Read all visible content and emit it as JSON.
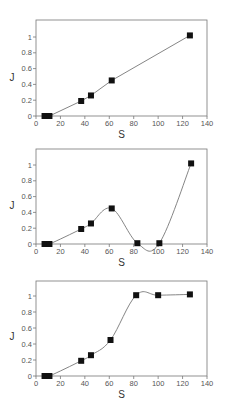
{
  "chart_data": [
    {
      "type": "line",
      "title": "",
      "xlabel": "S",
      "ylabel": "J",
      "xlim": [
        0,
        140
      ],
      "ylim": [
        0,
        1.2
      ],
      "xticks": [
        0,
        20,
        40,
        60,
        80,
        100,
        120,
        140
      ],
      "yticks": [
        0,
        0.2,
        0.4,
        0.6,
        0.8,
        1
      ],
      "grid": false,
      "legend": null,
      "marker": "square",
      "series": [
        {
          "name": "J vs S",
          "x": [
            7,
            11,
            37,
            45,
            62,
            126
          ],
          "y": [
            0,
            0,
            0.19,
            0.26,
            0.45,
            1.02
          ]
        }
      ],
      "curve_style": "straight"
    },
    {
      "type": "line",
      "title": "",
      "xlabel": "S",
      "ylabel": "J",
      "xlim": [
        0,
        140
      ],
      "ylim": [
        0,
        1.2
      ],
      "xticks": [
        0,
        20,
        40,
        60,
        80,
        100,
        120,
        140
      ],
      "yticks": [
        0,
        0.2,
        0.4,
        0.6,
        0.8,
        1
      ],
      "grid": false,
      "legend": null,
      "marker": "square",
      "series": [
        {
          "name": "J vs S",
          "x": [
            7,
            11,
            37,
            45,
            62,
            83,
            101,
            127
          ],
          "y": [
            0,
            0,
            0.19,
            0.26,
            0.45,
            0.01,
            0.01,
            1.02
          ]
        }
      ],
      "curve_style": "smooth"
    },
    {
      "type": "line",
      "title": "",
      "xlabel": "S",
      "ylabel": "J",
      "xlim": [
        0,
        140
      ],
      "ylim": [
        0,
        1.2
      ],
      "xticks": [
        0,
        20,
        40,
        60,
        80,
        100,
        120,
        140
      ],
      "yticks": [
        0,
        0.2,
        0.4,
        0.6,
        0.8,
        1
      ],
      "grid": false,
      "legend": null,
      "marker": "square",
      "series": [
        {
          "name": "J vs S",
          "x": [
            7,
            11,
            37,
            45,
            61,
            82,
            100,
            126
          ],
          "y": [
            0,
            0,
            0.19,
            0.26,
            0.45,
            1.01,
            1.01,
            1.02
          ]
        }
      ],
      "curve_style": "smooth"
    }
  ],
  "labels": {
    "xlabel": "S",
    "ylabel": "J",
    "xtick_labels": [
      "0",
      "20",
      "40",
      "60",
      "80",
      "100",
      "120",
      "140"
    ],
    "ytick_labels": [
      "0",
      "0.2",
      "0.4",
      "0.6",
      "0.8",
      "1"
    ]
  }
}
